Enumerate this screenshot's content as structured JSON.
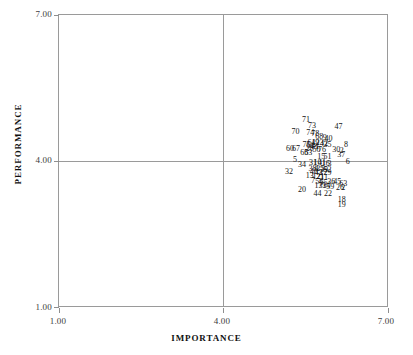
{
  "chart_data": {
    "type": "scatter",
    "title": "",
    "xlabel": "IMPORTANCE",
    "ylabel": "PERFORMANCE",
    "xlim": [
      1.0,
      7.0
    ],
    "ylim": [
      1.0,
      7.0
    ],
    "xticks": [
      "1.00",
      "4.00",
      "7.00"
    ],
    "yticks": [
      "1.00",
      "4.00",
      "7.00"
    ],
    "xtick_values": [
      1.0,
      4.0,
      7.0
    ],
    "ytick_values": [
      1.0,
      4.0,
      7.0
    ],
    "grid": true,
    "gridlines": {
      "x": [
        4.0
      ],
      "y": [
        4.0
      ]
    },
    "legend": "none",
    "marker_style": "numeric-label",
    "note": "Each data point is drawn as its case number label; labels overlap heavily in the dense cluster.",
    "points": [
      {
        "label": "71",
        "x": 5.49,
        "y": 4.86
      },
      {
        "label": "73",
        "x": 5.6,
        "y": 4.73
      },
      {
        "label": "47",
        "x": 6.08,
        "y": 4.7
      },
      {
        "label": "70",
        "x": 5.3,
        "y": 4.6
      },
      {
        "label": "74",
        "x": 5.57,
        "y": 4.58
      },
      {
        "label": "78",
        "x": 5.66,
        "y": 4.57
      },
      {
        "label": "68",
        "x": 5.73,
        "y": 4.5
      },
      {
        "label": "9",
        "x": 5.83,
        "y": 4.49
      },
      {
        "label": "40",
        "x": 5.9,
        "y": 4.47
      },
      {
        "label": "61",
        "x": 5.59,
        "y": 4.38
      },
      {
        "label": "49",
        "x": 5.66,
        "y": 4.38
      },
      {
        "label": "23",
        "x": 5.74,
        "y": 4.37
      },
      {
        "label": "42",
        "x": 5.82,
        "y": 4.36
      },
      {
        "label": "35",
        "x": 5.88,
        "y": 4.34
      },
      {
        "label": "8",
        "x": 6.22,
        "y": 4.34
      },
      {
        "label": "75",
        "x": 5.5,
        "y": 4.33
      },
      {
        "label": "64",
        "x": 5.57,
        "y": 4.31
      },
      {
        "label": "48",
        "x": 5.63,
        "y": 4.3
      },
      {
        "label": "1",
        "x": 5.7,
        "y": 4.29
      },
      {
        "label": "60",
        "x": 5.2,
        "y": 4.25
      },
      {
        "label": "67",
        "x": 5.31,
        "y": 4.25
      },
      {
        "label": "28",
        "x": 5.56,
        "y": 4.25
      },
      {
        "label": "50",
        "x": 5.68,
        "y": 4.24
      },
      {
        "label": "76",
        "x": 5.78,
        "y": 4.24
      },
      {
        "label": "30",
        "x": 6.04,
        "y": 4.23
      },
      {
        "label": "2",
        "x": 6.14,
        "y": 4.22
      },
      {
        "label": "66",
        "x": 5.46,
        "y": 4.18
      },
      {
        "label": "53",
        "x": 5.53,
        "y": 4.17
      },
      {
        "label": "37",
        "x": 6.13,
        "y": 4.14
      },
      {
        "label": "15",
        "x": 5.77,
        "y": 4.1
      },
      {
        "label": "51",
        "x": 5.88,
        "y": 4.09
      },
      {
        "label": "5",
        "x": 5.29,
        "y": 4.04
      },
      {
        "label": "6",
        "x": 6.25,
        "y": 4.0
      },
      {
        "label": "31",
        "x": 5.62,
        "y": 3.97
      },
      {
        "label": "10",
        "x": 5.7,
        "y": 3.96
      },
      {
        "label": "41",
        "x": 5.78,
        "y": 3.96
      },
      {
        "label": "16",
        "x": 5.85,
        "y": 3.95
      },
      {
        "label": "3",
        "x": 5.92,
        "y": 3.95
      },
      {
        "label": "34",
        "x": 5.42,
        "y": 3.92
      },
      {
        "label": "38",
        "x": 5.61,
        "y": 3.85
      },
      {
        "label": "4",
        "x": 5.68,
        "y": 3.85
      },
      {
        "label": "25",
        "x": 5.75,
        "y": 3.84
      },
      {
        "label": "39",
        "x": 5.82,
        "y": 3.83
      },
      {
        "label": "52",
        "x": 5.88,
        "y": 3.83
      },
      {
        "label": "32",
        "x": 5.18,
        "y": 3.79
      },
      {
        "label": "46",
        "x": 5.63,
        "y": 3.78
      },
      {
        "label": "43",
        "x": 5.72,
        "y": 3.77
      },
      {
        "label": "27",
        "x": 5.8,
        "y": 3.76
      },
      {
        "label": "29",
        "x": 5.88,
        "y": 3.76
      },
      {
        "label": "13",
        "x": 5.56,
        "y": 3.7
      },
      {
        "label": "12",
        "x": 5.68,
        "y": 3.68
      },
      {
        "label": "21",
        "x": 5.75,
        "y": 3.68
      },
      {
        "label": "11",
        "x": 5.82,
        "y": 3.67
      },
      {
        "label": "7",
        "x": 5.62,
        "y": 3.6
      },
      {
        "label": "56",
        "x": 5.73,
        "y": 3.58
      },
      {
        "label": "36",
        "x": 5.95,
        "y": 3.57
      },
      {
        "label": "45",
        "x": 6.06,
        "y": 3.58
      },
      {
        "label": "63",
        "x": 6.17,
        "y": 3.54
      },
      {
        "label": "55",
        "x": 5.81,
        "y": 3.56
      },
      {
        "label": "17",
        "x": 5.72,
        "y": 3.5
      },
      {
        "label": "33",
        "x": 5.79,
        "y": 3.49
      },
      {
        "label": "14",
        "x": 5.86,
        "y": 3.49
      },
      {
        "label": "59",
        "x": 5.93,
        "y": 3.48
      },
      {
        "label": "26",
        "x": 6.11,
        "y": 3.45
      },
      {
        "label": "2",
        "x": 6.17,
        "y": 3.45
      },
      {
        "label": "20",
        "x": 5.42,
        "y": 3.42
      },
      {
        "label": "44",
        "x": 5.7,
        "y": 3.33
      },
      {
        "label": "22",
        "x": 5.89,
        "y": 3.33
      },
      {
        "label": "18",
        "x": 6.14,
        "y": 3.22
      },
      {
        "label": "19",
        "x": 6.14,
        "y": 3.1
      }
    ]
  }
}
